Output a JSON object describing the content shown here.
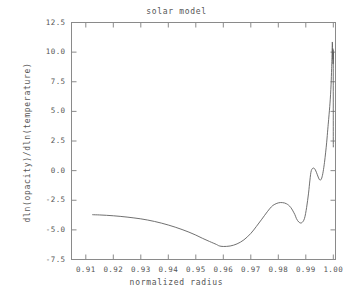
{
  "chart_data": {
    "type": "line",
    "title": "solar model",
    "xlabel": "normalized radius",
    "ylabel": "dln(opacity)/dln(temperature)",
    "xlim": [
      0.9048,
      1.0008
    ],
    "ylim": [
      -7.5,
      12.5
    ],
    "xticks": [
      0.91,
      0.92,
      0.93,
      0.94,
      0.95,
      0.96,
      0.97,
      0.98,
      0.99,
      1.0
    ],
    "xticklabels": [
      "0.91",
      "0.92",
      "0.93",
      "0.94",
      "0.95",
      "0.96",
      "0.97",
      "0.98",
      "0.99",
      "1.00"
    ],
    "yticks": [
      -7.5,
      -5.0,
      -2.5,
      0.0,
      2.5,
      5.0,
      7.5,
      10.0,
      12.5
    ],
    "yticklabels": [
      "-7.5",
      "-5.0",
      "-2.5",
      "0.0",
      "2.5",
      "5.0",
      "7.5",
      "10.0",
      "12.5"
    ],
    "grid": false,
    "legend": null,
    "line_color": "#606060",
    "frame_color": "#808080",
    "background": "#ffffff",
    "series": [
      {
        "name": "dln(opacity)/dln(temperature)",
        "x": [
          0.9125,
          0.915,
          0.9175,
          0.92,
          0.9225,
          0.925,
          0.9275,
          0.93,
          0.9325,
          0.935,
          0.9375,
          0.94,
          0.9425,
          0.945,
          0.9475,
          0.95,
          0.9525,
          0.955,
          0.9575,
          0.9585,
          0.96,
          0.9625,
          0.965,
          0.9675,
          0.97,
          0.972,
          0.974,
          0.976,
          0.9775,
          0.9785,
          0.98,
          0.9815,
          0.983,
          0.9845,
          0.986,
          0.9866,
          0.9875,
          0.9885,
          0.9895,
          0.9903,
          0.991,
          0.9915,
          0.992,
          0.9928,
          0.9935,
          0.9942,
          0.9948,
          0.9953,
          0.9958,
          0.9963,
          0.9968,
          0.9972,
          0.9976,
          0.998,
          0.9983,
          0.9986,
          0.9988,
          0.999,
          0.9992,
          0.9993,
          0.9994,
          0.9995,
          0.99955,
          0.9996,
          0.99965,
          0.9997,
          0.99975,
          0.9998,
          0.99985,
          0.9999,
          0.99993,
          0.99996,
          0.99998,
          1.0
        ],
        "y": [
          -3.72,
          -3.74,
          -3.77,
          -3.81,
          -3.86,
          -3.92,
          -3.99,
          -4.07,
          -4.17,
          -4.29,
          -4.43,
          -4.59,
          -4.77,
          -4.97,
          -5.19,
          -5.44,
          -5.72,
          -5.98,
          -6.23,
          -6.35,
          -6.4,
          -6.36,
          -6.18,
          -5.84,
          -5.3,
          -4.72,
          -4.1,
          -3.47,
          -3.05,
          -2.87,
          -2.72,
          -2.7,
          -2.8,
          -3.1,
          -3.7,
          -4.05,
          -4.35,
          -4.4,
          -4.05,
          -3.1,
          -1.9,
          -0.8,
          0.0,
          0.22,
          0.05,
          -0.35,
          -0.7,
          -0.8,
          -0.62,
          -0.1,
          0.7,
          1.5,
          2.4,
          3.5,
          4.3,
          5.1,
          5.7,
          6.4,
          7.3,
          7.95,
          8.6,
          9.4,
          9.9,
          10.4,
          10.85,
          10.6,
          9.8,
          10.3,
          9.4,
          10.2,
          9.0,
          10.0,
          8.6,
          2.0
        ]
      }
    ]
  }
}
